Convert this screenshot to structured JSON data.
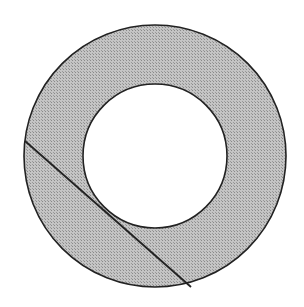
{
  "diagram": {
    "type": "annulus-with-tangent-chord",
    "colors": {
      "background": "#ffffff",
      "ring_fill": "#b4b4b4",
      "stroke": "#222222"
    },
    "outer_circle": {
      "cx": 155,
      "cy": 156,
      "r": 131
    },
    "inner_circle": {
      "cx": 155,
      "cy": 156,
      "r": 72
    },
    "chord": {
      "x1": 25,
      "y1": 141,
      "x2": 191,
      "y2": 287
    }
  }
}
